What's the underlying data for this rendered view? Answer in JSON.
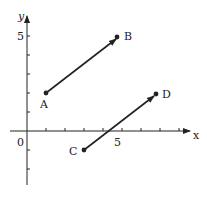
{
  "diagram": {
    "type": "coordinate-plane-vectors",
    "axes": {
      "x_label": "x",
      "y_label": "y",
      "origin_label": "0",
      "x_tick_label": "5",
      "y_tick_label": "5",
      "x_ticks": [
        1,
        2,
        3,
        4,
        5,
        6,
        7,
        8
      ],
      "y_ticks": [
        -2,
        -1,
        1,
        2,
        3,
        4,
        5
      ]
    },
    "points": [
      {
        "name": "A",
        "x": 1,
        "y": 2
      },
      {
        "name": "B",
        "x": 5,
        "y": 5
      },
      {
        "name": "C",
        "x": 3,
        "y": -1
      },
      {
        "name": "D",
        "x": 7,
        "y": 2
      }
    ],
    "vectors": [
      {
        "from": "A",
        "to": "B"
      },
      {
        "from": "C",
        "to": "D"
      }
    ],
    "colors": {
      "ink": "#222222",
      "background": "#ffffff"
    }
  }
}
